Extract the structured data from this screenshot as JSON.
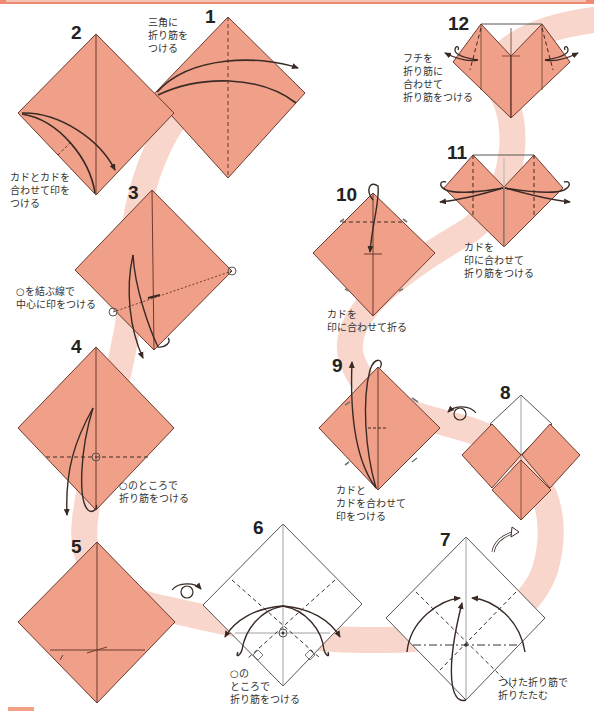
{
  "colors": {
    "paper_front": "#f0a088",
    "paper_edge": "#6b3a2e",
    "path_ribbon": "#f9d6cb",
    "top_bar": "#ee8a72",
    "line": "#3a2a25"
  },
  "steps": [
    {
      "number": "1",
      "note": "三角に\n折り筋を\nつける"
    },
    {
      "number": "2",
      "note": "カドとカドを\n合わせて印を\nつける"
    },
    {
      "number": "3",
      "note": "○を結ぶ線で\n中心に印をつける"
    },
    {
      "number": "4",
      "note": "○のところで\n折り筋をつける"
    },
    {
      "number": "5",
      "note": ""
    },
    {
      "number": "6",
      "note": "○の\nところで\n折り筋をつける"
    },
    {
      "number": "7",
      "note": "つけた折り筋で\n折りたたむ"
    },
    {
      "number": "8",
      "note": ""
    },
    {
      "number": "9",
      "note": "カドと\nカドを合わせて\n印をつける"
    },
    {
      "number": "10",
      "note": "カドを\n印に合わせて折る"
    },
    {
      "number": "11",
      "note": "カドを\n印に合わせて\n折り筋をつける"
    },
    {
      "number": "12",
      "note": "フチを\n折り筋に\n合わせて\n折り筋をつける"
    }
  ],
  "symbols": {
    "turn_over": "turn-over-icon",
    "rotate": "rotate-arrow-icon"
  }
}
